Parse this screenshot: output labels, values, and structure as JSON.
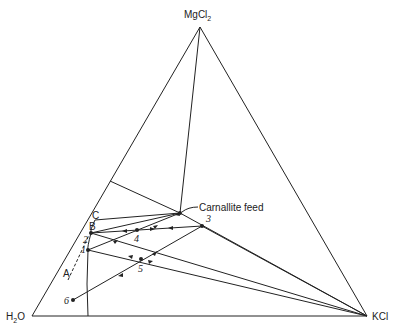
{
  "diagram": {
    "type": "ternary-phase-diagram",
    "vertices": {
      "top": {
        "label_main": "MgCl",
        "label_sub": "2"
      },
      "left": {
        "label_main": "H",
        "label_sub": "2",
        "label_tail": "O"
      },
      "right": {
        "label_main": "KCl"
      }
    },
    "annotations": {
      "carnallite_feed": "Carnallite feed",
      "C": "C",
      "B": "B",
      "A": "A"
    },
    "points": [
      {
        "id": "1",
        "label": "1"
      },
      {
        "id": "2",
        "label": "2"
      },
      {
        "id": "3",
        "label": "3"
      },
      {
        "id": "4",
        "label": "4"
      },
      {
        "id": "5",
        "label": "5"
      },
      {
        "id": "6",
        "label": "6"
      }
    ]
  }
}
